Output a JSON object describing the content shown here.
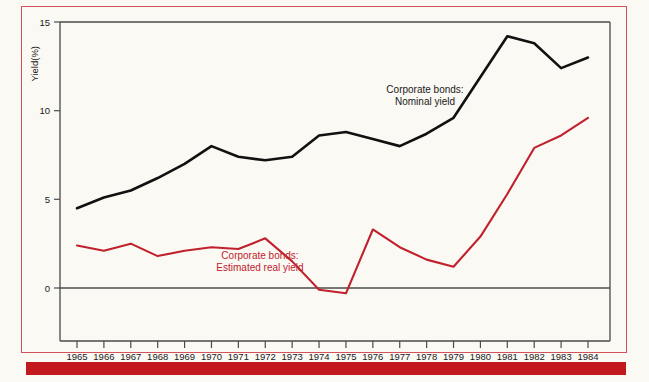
{
  "colors": {
    "nominal": "#111111",
    "real": "#c0212c",
    "frame_rule": "#d2515a",
    "bottom_bar": "#c4181f",
    "background": "#fbf9f4",
    "axis": "#4a4a4a"
  },
  "annotations": {
    "nominal_line1": "Corporate bonds:",
    "nominal_line2": "Nominal yield",
    "real_line1": "Corporate bonds:",
    "real_line2": "Estimated real yield"
  },
  "axes": {
    "y_title": "Yield(%)",
    "y_ticks": [
      "0",
      "5",
      "10",
      "15"
    ],
    "x_ticks": [
      "1965",
      "1966",
      "1967",
      "1968",
      "1969",
      "1970",
      "1971",
      "1972",
      "1973",
      "1974",
      "1975",
      "1976",
      "1977",
      "1978",
      "1979",
      "1980",
      "1981",
      "1982",
      "1983",
      "1984"
    ]
  },
  "chart_data": {
    "type": "line",
    "title": "",
    "subtitle": "",
    "xlabel": "",
    "ylabel": "Yield(%)",
    "xlim": [
      1965,
      1984
    ],
    "ylim": [
      -1,
      15
    ],
    "y_ticks": [
      0,
      5,
      10,
      15
    ],
    "grid": false,
    "legend_position": "inline-annotation",
    "x": [
      1965,
      1966,
      1967,
      1968,
      1969,
      1970,
      1971,
      1972,
      1973,
      1974,
      1975,
      1976,
      1977,
      1978,
      1979,
      1980,
      1981,
      1982,
      1983,
      1984
    ],
    "series": [
      {
        "name": "Corporate bonds: Nominal yield",
        "color": "#111111",
        "values": [
          4.5,
          5.1,
          5.5,
          6.2,
          7.0,
          8.0,
          7.4,
          7.2,
          7.4,
          8.6,
          8.8,
          8.4,
          8.0,
          8.7,
          9.6,
          11.9,
          14.2,
          13.8,
          12.4,
          13.0
        ]
      },
      {
        "name": "Corporate bonds: Estimated real yield",
        "color": "#c0212c",
        "values": [
          2.4,
          2.1,
          2.5,
          1.8,
          2.1,
          2.3,
          2.2,
          2.8,
          1.5,
          -0.1,
          -0.3,
          3.3,
          2.3,
          1.6,
          1.2,
          2.9,
          5.3,
          7.9,
          8.6,
          9.6
        ]
      }
    ]
  }
}
